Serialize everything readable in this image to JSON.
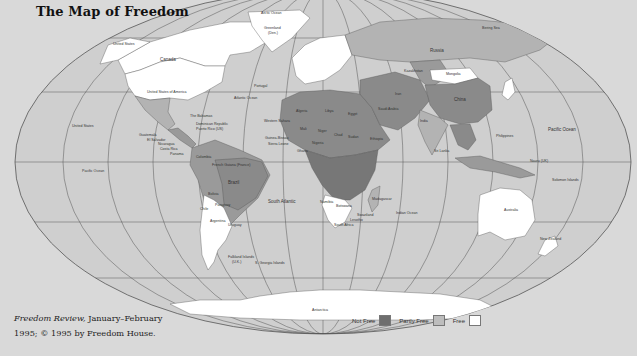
{
  "title": "The Map of Freedom",
  "credit": {
    "publication": "Freedom Review,",
    "line1_rest": " January–February",
    "line2": "1995; © 1995 by Freedom House."
  },
  "legend": {
    "items": [
      {
        "label": "Not Free",
        "color": "#6e6e6e"
      },
      {
        "label": "Partly Free",
        "color": "#bdbdbd"
      },
      {
        "label": "Free",
        "color": "#ffffff"
      }
    ]
  },
  "colors": {
    "background": "#d9d9d9",
    "ocean": "#cfcfcf",
    "not_free": "#6e6e6e",
    "partly_free": "#b3b3b3",
    "free": "#ffffff",
    "grid": "#555555"
  },
  "labels": {
    "arctic_ocean": "Arctic Ocean",
    "greenland": "Greenland",
    "greenland_sub": "(Den.)",
    "canada": "Canada",
    "united_states_alaska": "United States",
    "usa": "United States of America",
    "atlantic_ocean": "Atlantic Ocean",
    "the_bahamas": "The Bahamas",
    "dominican_republic": "Dominican Republic",
    "puerto_rico": "Puerto Rico (US)",
    "united_states_hawaii": "United States",
    "guatemala": "Guatemala",
    "el_salvador": "El Salvador",
    "nicaragua": "Nicaragua",
    "costa_rica": "Costa Rica",
    "panama": "Panama",
    "pacific_ocean_west": "Pacific Ocean",
    "pacific_ocean_east": "Pacific Ocean",
    "colombia": "Colombia",
    "brazil": "Brazil",
    "bolivia": "Bolivia",
    "chile": "Chile",
    "paraguay": "Paraguay",
    "argentina": "Argentina",
    "uruguay": "Uruguay",
    "falkland_islands": "Falkland Islands",
    "falkland_sub": "(U.K.)",
    "s_georgia": "S. Georgia Islands",
    "south_atlantic": "South Atlantic",
    "western_sahara": "Western Sahara",
    "french_guiana": "French Guiana (France)",
    "russia": "Russia",
    "kazakhstan": "Kazakhstan",
    "mongolia": "Mongolia",
    "china": "China",
    "india": "India",
    "sri_lanka": "Sri Lanka",
    "philippines": "Philippines",
    "bering_sea": "Bering Sea",
    "new_zealand": "New Zealand",
    "australia": "Australia",
    "solomon_islands": "Solomon Islands",
    "nauru": "Nauru (UK)",
    "indian_ocean": "Indian Ocean",
    "madagascar": "Madagascar",
    "namibia": "Namibia",
    "botswana": "Botswana",
    "swaziland": "Swaziland",
    "south_africa": "South Africa",
    "lesotho": "Lesotho",
    "antarctica": "Antarctica",
    "algeria": "Algeria",
    "libya": "Libya",
    "egypt": "Egypt",
    "mali": "Mali",
    "niger": "Niger",
    "chad": "Chad",
    "sudan": "Sudan",
    "nigeria": "Nigeria",
    "ghana": "Ghana",
    "sierra_leone": "Sierra Leone",
    "guinea_bissau": "Guinea-Bissau",
    "ethiopia": "Ethiopia",
    "saudi_arabia": "Saudi Arabia",
    "iran": "Iran",
    "portugal": "Portugal"
  }
}
